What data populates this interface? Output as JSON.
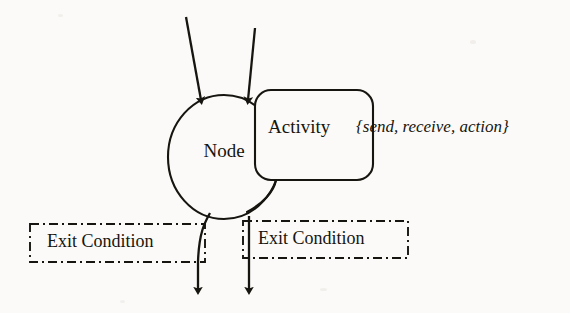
{
  "diagram": {
    "type": "state-node-notation",
    "background_color": "#fbfaf8",
    "ink_color": "#16150f",
    "nodes": [
      {
        "id": "node",
        "shape": "ellipse",
        "label": "Node",
        "cx": 224,
        "cy": 157,
        "rx": 56,
        "ry": 62
      },
      {
        "id": "activity",
        "shape": "rounded-rectangle",
        "label": "Activity",
        "x": 255,
        "y": 90,
        "width": 118,
        "height": 90,
        "corner_radius": 16
      }
    ],
    "annotation": {
      "id": "activity-kinds",
      "text": "{send, receive, action}",
      "style": "italic",
      "x": 356,
      "y": 117
    },
    "exit_conditions": [
      {
        "id": "exit-condition-left",
        "label": "Exit Condition",
        "x": 30,
        "y": 224,
        "width": 175,
        "height": 38,
        "border_style": "dash-dot"
      },
      {
        "id": "exit-condition-right",
        "label": "Exit Condition",
        "x": 243,
        "y": 221,
        "width": 165,
        "height": 37,
        "border_style": "dash-dot"
      }
    ],
    "incoming_transitions": [
      {
        "id": "incoming-transition-left",
        "from_x": 186,
        "from_y": 17,
        "to_x": 202,
        "to_y": 106
      },
      {
        "id": "incoming-transition-right",
        "from_x": 255,
        "from_y": 28,
        "to_x": 247,
        "to_y": 106
      }
    ],
    "outgoing_transitions": [
      {
        "id": "outgoing-transition-left",
        "from_x": 208,
        "from_y": 214,
        "to_x": 198,
        "to_y": 296
      },
      {
        "id": "outgoing-transition-right",
        "from_x": 249,
        "from_y": 216,
        "to_x": 249,
        "to_y": 296
      }
    ],
    "connector": {
      "id": "node-activity-connector",
      "description": "curve from activity box bottom-left to node ellipse"
    }
  }
}
